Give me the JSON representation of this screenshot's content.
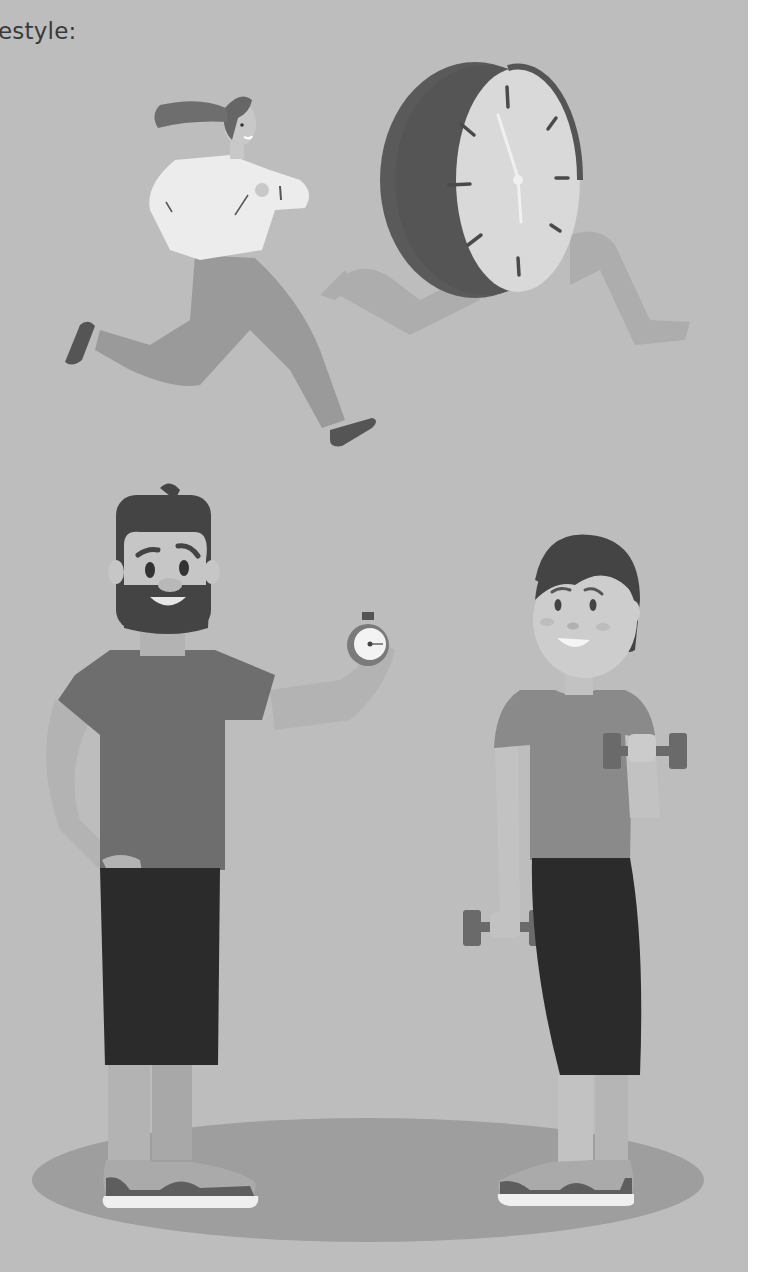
{
  "page": {
    "caption_fragment": "estyle:",
    "colors": {
      "background": "#bdbdbd",
      "page_margin": "#ffffff",
      "text": "#3a3a3a",
      "floor_shadow": "#9e9e9e"
    }
  },
  "illustration": {
    "description": "Healthy lifestyle illustration",
    "figures": [
      {
        "id": "running-woman",
        "label": "Woman running, checking wristwatch"
      },
      {
        "id": "running-clock",
        "label": "Wall clock with legs running"
      },
      {
        "id": "bearded-man",
        "label": "Bearded man holding a stopwatch"
      },
      {
        "id": "woman-dumbbells",
        "label": "Woman lifting dumbbells"
      }
    ],
    "clock": {
      "tick_count": 12
    }
  }
}
